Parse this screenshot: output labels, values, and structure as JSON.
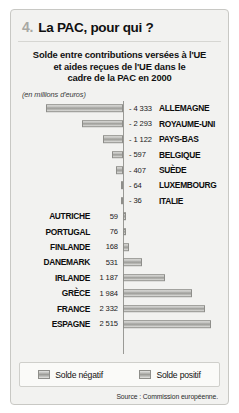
{
  "header": {
    "number": "4.",
    "title": "La PAC, pour qui ?"
  },
  "chart_title": {
    "line1": "Solde entre contributions versées à l'UE",
    "line2": "et aides reçues de l'UE dans le",
    "line3": "cadre de la PAC en 2000"
  },
  "units": "(en millions d'euros)",
  "legend": {
    "negative_label": "Solde négatif",
    "positive_label": "Solde positif",
    "swatch_color": "#9d9d99"
  },
  "source": "Source : Commission européenne.",
  "chart_data": {
    "type": "bar",
    "orientation": "horizontal",
    "title": "Solde entre contributions versées à l'UE et aides reçues de l'UE dans le cadre de la PAC en 2000",
    "xlabel": "en millions d'euros",
    "ylabel": "",
    "xlim": [
      -4333,
      2515
    ],
    "grid": false,
    "legend_position": "bottom",
    "categories": [
      "ALLEMAGNE",
      "ROYAUME-UNI",
      "PAYS-BAS",
      "BELGIQUE",
      "SUÈDE",
      "LUXEMBOURG",
      "ITALIE",
      "AUTRICHE",
      "PORTUGAL",
      "FINLANDE",
      "DANEMARK",
      "IRLANDE",
      "GRÈCE",
      "FRANCE",
      "ESPAGNE"
    ],
    "values": [
      -4333,
      -2293,
      -1122,
      -597,
      -407,
      -64,
      -36,
      59,
      76,
      168,
      531,
      1187,
      1984,
      2332,
      2515
    ],
    "value_labels": [
      "- 4 333",
      "- 2 293",
      "- 1 122",
      "- 597",
      "- 407",
      "- 64",
      "- 36",
      "59",
      "76",
      "168",
      "531",
      "1 187",
      "1 984",
      "2 332",
      "2 515"
    ],
    "series": [
      {
        "name": "Solde négatif",
        "items": [
          {
            "country": "ALLEMAGNE",
            "value": -4333,
            "label": "- 4 333"
          },
          {
            "country": "ROYAUME-UNI",
            "value": -2293,
            "label": "- 2 293"
          },
          {
            "country": "PAYS-BAS",
            "value": -1122,
            "label": "- 1 122"
          },
          {
            "country": "BELGIQUE",
            "value": -597,
            "label": "- 597"
          },
          {
            "country": "SUÈDE",
            "value": -407,
            "label": "- 407"
          },
          {
            "country": "LUXEMBOURG",
            "value": -64,
            "label": "- 64"
          },
          {
            "country": "ITALIE",
            "value": -36,
            "label": "- 36"
          }
        ]
      },
      {
        "name": "Solde positif",
        "items": [
          {
            "country": "AUTRICHE",
            "value": 59,
            "label": "59"
          },
          {
            "country": "PORTUGAL",
            "value": 76,
            "label": "76"
          },
          {
            "country": "FINLANDE",
            "value": 168,
            "label": "168"
          },
          {
            "country": "DANEMARK",
            "value": 531,
            "label": "531"
          },
          {
            "country": "IRLANDE",
            "value": 1187,
            "label": "1 187"
          },
          {
            "country": "GRÈCE",
            "value": 1984,
            "label": "1 984"
          },
          {
            "country": "FRANCE",
            "value": 2332,
            "label": "2 332"
          },
          {
            "country": "ESPAGNE",
            "value": 2515,
            "label": "2 515"
          }
        ]
      }
    ]
  }
}
